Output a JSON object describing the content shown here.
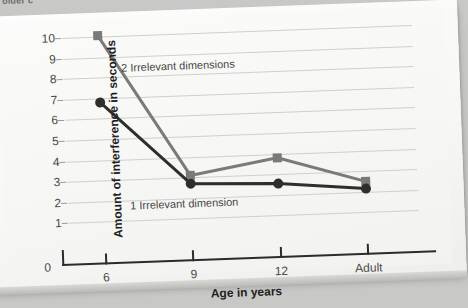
{
  "page": {
    "cut_off_caption": "older c"
  },
  "chart_data": {
    "type": "line",
    "title": "",
    "xlabel": "Age in years",
    "ylabel": "Amount of interference in seconds",
    "categories": [
      "6",
      "9",
      "12",
      "Adult"
    ],
    "ylim": [
      0,
      10
    ],
    "yticks": [
      0,
      1,
      2,
      3,
      4,
      5,
      6,
      7,
      8,
      9,
      10
    ],
    "grid": true,
    "legend_position": "inline-annotation",
    "series": [
      {
        "name": "2 Irrelevant dimensions",
        "marker": "square",
        "color": "#7a7a78",
        "values": [
          10.05,
          3.1,
          3.8,
          2.5
        ]
      },
      {
        "name": "1 Irrelevant dimension",
        "marker": "circle",
        "color": "#2e2e2c",
        "values": [
          6.8,
          2.7,
          2.55,
          2.15
        ]
      }
    ],
    "annotations": [
      {
        "text": "2 Irrelevant dimensions",
        "x": "between 6 and 9",
        "y": 8.8
      },
      {
        "text": "1 Irrelevant dimension",
        "x": "between 6 and 9",
        "y": 2.1
      }
    ]
  }
}
